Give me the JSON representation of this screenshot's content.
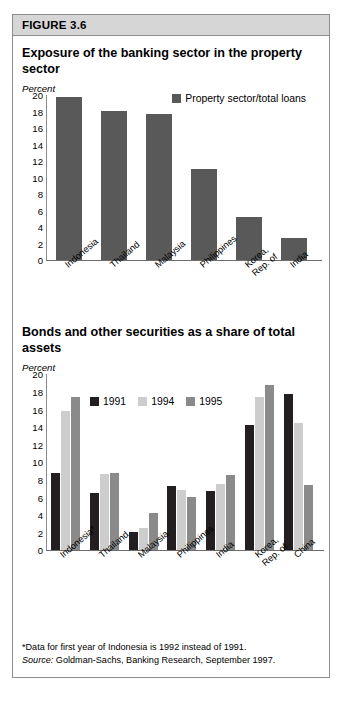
{
  "figure": {
    "header_label": "FIGURE 3.6"
  },
  "panels": [
    {
      "title": "Exposure of the banking sector in the property sector",
      "unit_label": "Percent"
    },
    {
      "title": "Bonds and other securities as a share of total assets",
      "unit_label": "Percent"
    }
  ],
  "notes": {
    "footnote": "*Data for first year of Indonesia is 1992 instead of 1991.",
    "source_prefix": "Source:",
    "source_text": " Goldman-Sachs, Banking Research, September 1997."
  },
  "colors": {
    "series_1991": "#231f20",
    "series_1994": "#cdcdcd",
    "series_1995": "#8a8a8a",
    "property_loans": "#595959",
    "axis": "#8d8d8d",
    "header_bg": "#d6d6d6",
    "frame_border": "#8d8d8d"
  },
  "chart_data": [
    {
      "type": "bar",
      "title": "Exposure of the banking sector in the property sector",
      "xlabel": "",
      "ylabel": "Percent",
      "ylim": [
        0,
        20
      ],
      "yticks": [
        0,
        2,
        4,
        6,
        8,
        10,
        12,
        14,
        16,
        18,
        20
      ],
      "grid": false,
      "legend_position": "top-right",
      "categories": [
        "Indonesia",
        "Thailand",
        "Malaysia",
        "Philippines",
        "Korea,\nRep. of",
        "India"
      ],
      "series": [
        {
          "name": "Property sector/total loans",
          "color": "#595959",
          "values": [
            19.8,
            18.1,
            17.7,
            11.1,
            5.2,
            2.7
          ]
        }
      ]
    },
    {
      "type": "bar",
      "title": "Bonds and other securities as a share of total assets",
      "xlabel": "",
      "ylabel": "Percent",
      "ylim": [
        0,
        20
      ],
      "yticks": [
        0,
        2,
        4,
        6,
        8,
        10,
        12,
        14,
        16,
        18,
        20
      ],
      "grid": false,
      "legend_position": "top-center",
      "categories": [
        "Indonesia*",
        "Thailand",
        "Malaysia",
        "Philippines",
        "India",
        "Korea,\nRep. of",
        "China"
      ],
      "series": [
        {
          "name": "1991",
          "color": "#231f20",
          "values": [
            8.8,
            6.5,
            2.1,
            7.3,
            6.7,
            14.3,
            17.8
          ]
        },
        {
          "name": "1994",
          "color": "#cdcdcd",
          "values": [
            15.8,
            8.7,
            2.6,
            6.9,
            7.5,
            17.4,
            14.5
          ]
        },
        {
          "name": "1995",
          "color": "#8a8a8a",
          "values": [
            17.4,
            8.8,
            4.2,
            6.1,
            8.6,
            18.8,
            7.4
          ]
        }
      ]
    }
  ]
}
